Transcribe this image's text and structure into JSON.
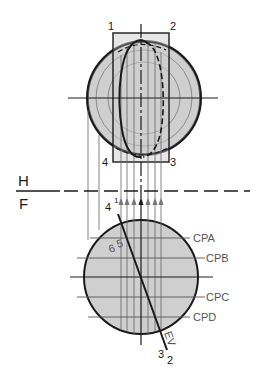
{
  "diagram": {
    "fold_line": {
      "top_label": "H",
      "bottom_label": "F"
    },
    "top_view": {
      "corner_labels": [
        "1",
        "2",
        "3",
        "4"
      ]
    },
    "front_view": {
      "edge_labels": {
        "top": "4",
        "top_sub": "1",
        "bottom": "3",
        "bottom_sub": "2",
        "edge_view": "EV"
      },
      "point_labels": {
        "a": "6",
        "b": "5"
      },
      "cutting_planes": [
        "CPA",
        "CPB",
        "CPC",
        "CPD"
      ]
    },
    "colors": {
      "fill": "#cfcfcf",
      "line": "#1a1a1a",
      "thin": "#666666"
    }
  }
}
